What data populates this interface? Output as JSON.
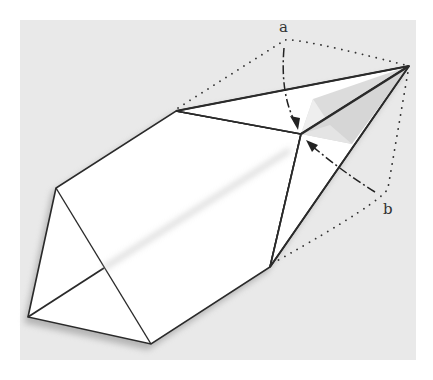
{
  "diagram": {
    "type": "origami-fold-step",
    "labels": {
      "a": "a",
      "b": "b"
    },
    "colors": {
      "background_paper": "#e9e9e9",
      "paper_white": "#ffffff",
      "shade_light": "#dcdcdc",
      "shade_mid": "#c9c9c9",
      "edge": "#2a2a2a"
    },
    "annotations": [
      {
        "id": "a",
        "description": "dashed arrow folding top flap down to center point"
      },
      {
        "id": "b",
        "description": "dashed arrow folding right flap up to center point"
      }
    ]
  }
}
